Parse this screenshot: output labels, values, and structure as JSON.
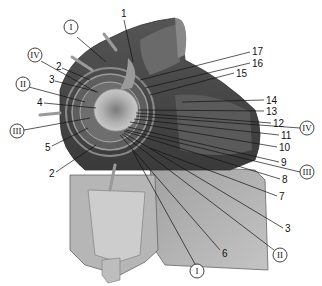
{
  "diagram": {
    "type": "anatomical-cross-section",
    "colors": {
      "background": "#ffffff",
      "dark_tissue": "#4a4a4a",
      "mid_tissue": "#8a8a8a",
      "light_tissue": "#b8b8b8",
      "line": "#111111"
    },
    "numbered_labels": [
      {
        "id": "n1",
        "text": "1",
        "x": 121,
        "y": 17
      },
      {
        "id": "n17",
        "text": "17",
        "x": 254,
        "y": 52
      },
      {
        "id": "n16",
        "text": "16",
        "x": 254,
        "y": 64
      },
      {
        "id": "n2a",
        "text": "2",
        "x": 58,
        "y": 66
      },
      {
        "id": "n15",
        "text": "15",
        "x": 237,
        "y": 74
      },
      {
        "id": "n3a",
        "text": "3",
        "x": 51,
        "y": 79
      },
      {
        "id": "n4",
        "text": "4",
        "x": 39,
        "y": 103
      },
      {
        "id": "n14",
        "text": "14",
        "x": 268,
        "y": 101
      },
      {
        "id": "n13",
        "text": "13",
        "x": 268,
        "y": 112
      },
      {
        "id": "n12",
        "text": "12",
        "x": 275,
        "y": 124
      },
      {
        "id": "n11",
        "text": "11",
        "x": 283,
        "y": 136
      },
      {
        "id": "n5",
        "text": "5",
        "x": 47,
        "y": 148
      },
      {
        "id": "n10",
        "text": "10",
        "x": 281,
        "y": 148
      },
      {
        "id": "n2b",
        "text": "2",
        "x": 51,
        "y": 174
      },
      {
        "id": "n9",
        "text": "9",
        "x": 283,
        "y": 163
      },
      {
        "id": "n8",
        "text": "8",
        "x": 284,
        "y": 180
      },
      {
        "id": "n7",
        "text": "7",
        "x": 281,
        "y": 197
      },
      {
        "id": "n3b",
        "text": "3",
        "x": 287,
        "y": 229
      },
      {
        "id": "n6",
        "text": "6",
        "x": 224,
        "y": 254
      }
    ],
    "roman_labels": [
      {
        "id": "rI_top",
        "text": "I",
        "x": 71,
        "y": 31
      },
      {
        "id": "rIV_left",
        "text": "IV",
        "x": 35,
        "y": 56
      },
      {
        "id": "rII_left",
        "text": "II",
        "x": 23,
        "y": 84
      },
      {
        "id": "rIII_left",
        "text": "III",
        "x": 17,
        "y": 131
      },
      {
        "id": "rIV_right",
        "text": "IV",
        "x": 307,
        "y": 128
      },
      {
        "id": "rIII_right",
        "text": "III",
        "x": 307,
        "y": 172
      },
      {
        "id": "rII_bottom",
        "text": "II",
        "x": 280,
        "y": 255
      },
      {
        "id": "rI_bottom",
        "text": "I",
        "x": 197,
        "y": 271
      }
    ]
  }
}
